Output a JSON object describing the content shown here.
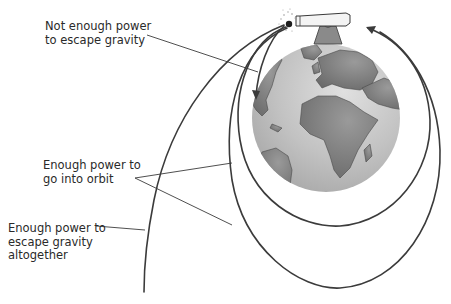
{
  "diagram": {
    "labels": {
      "not_enough": [
        "Not enough power",
        "to escape gravity"
      ],
      "orbit": [
        "Enough power to",
        "go into orbit"
      ],
      "escape": [
        "Enough power to",
        "escape gravity",
        "altogether"
      ]
    },
    "elements": [
      "earth-globe",
      "cannon",
      "cannonball",
      "trajectory-fall",
      "trajectory-orbit-inner",
      "trajectory-orbit-outer",
      "trajectory-escape"
    ],
    "colors": {
      "line": "#3a3a3a",
      "ocean": "#bdbdbd",
      "land": "#7a7a7a",
      "cannon": "#8a8a8a"
    }
  }
}
